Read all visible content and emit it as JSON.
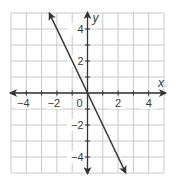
{
  "chart_data": {
    "type": "line",
    "title": "",
    "xlabel": "x",
    "ylabel": "y",
    "xlim": [
      -5,
      5
    ],
    "ylim": [
      -5,
      5
    ],
    "grid": true,
    "x_ticks": [
      -4,
      -2,
      0,
      2,
      4
    ],
    "y_ticks": [
      -4,
      -2,
      2,
      4
    ],
    "tick_labels": {
      "x": [
        "−4",
        "−2",
        "2",
        "4"
      ],
      "y": [
        "4",
        "2",
        "−2",
        "−4"
      ],
      "origin": "0"
    },
    "series": [
      {
        "name": "y = -2x",
        "equation": "y = -2x",
        "slope": -2,
        "intercept": 0,
        "x": [
          -2.5,
          0,
          2.5
        ],
        "y": [
          5,
          0,
          -5
        ],
        "arrows": "both"
      }
    ],
    "legend": null
  },
  "colors": {
    "grid": "#c8c8c8",
    "axis": "#333333",
    "line": "#3a3a3a",
    "text": "#3a3a3a",
    "background": "#ffffff"
  }
}
